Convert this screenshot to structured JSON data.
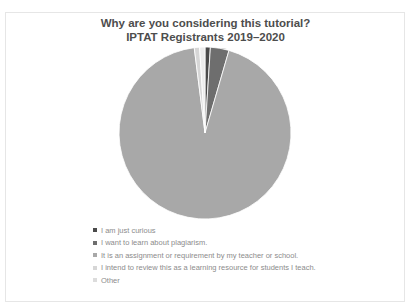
{
  "chart_data": {
    "type": "pie",
    "title": "Why are you considering this tutorial?",
    "subtitle": "IPTAT Registrants 2019–2020",
    "categories": [
      "I am just curious",
      "I want to learn about plagiarism.",
      "It is an assignment or requirement by my teacher or school.",
      "I intend to review this as a learning resource for students I teach.",
      "Other"
    ],
    "values": [
      1.0,
      3.5,
      93.5,
      1.0,
      1.0
    ],
    "unit": "percent (estimated from slice angles)",
    "colors": [
      "#4a4a4a",
      "#6e6e6e",
      "#a8a8a8",
      "#d6d6d6",
      "#ececec"
    ],
    "legend_position": "bottom-left",
    "data_labels_visible": true
  },
  "title": {
    "line1": "Why are you considering this tutorial?",
    "line2": "IPTAT Registrants 2019–2020"
  },
  "legend": {
    "items": [
      {
        "label": "I am just curious",
        "color": "#4a4a4a"
      },
      {
        "label": "I want to learn about plagiarism.",
        "color": "#6e6e6e"
      },
      {
        "label": "It is an assignment or requirement by my teacher or school.",
        "color": "#a8a8a8"
      },
      {
        "label": "I intend to review this as a learning resource for students I teach.",
        "color": "#d6d6d6"
      },
      {
        "label": "Other",
        "color": "#ececec"
      }
    ]
  }
}
